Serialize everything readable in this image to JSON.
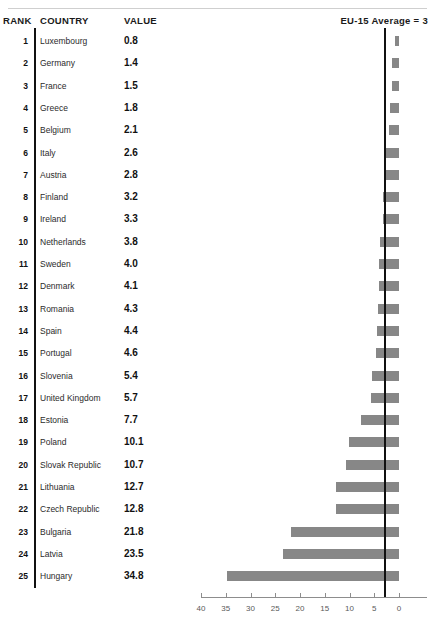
{
  "header": {
    "rank_label": "RANK",
    "country_label": "COUNTRY",
    "value_label": "VALUE",
    "average_label": "EU-15 Average = 3"
  },
  "colors": {
    "bar_fill": "#878787",
    "average_line": "#111111",
    "axis": "#8d8d8d",
    "divider": "#111111",
    "top_rule": "#cfcfcf"
  },
  "chart_data": {
    "type": "bar",
    "orientation": "horizontal",
    "title": "",
    "xlabel": "",
    "ylabel": "",
    "xlim": [
      40,
      0
    ],
    "x_axis_reversed": true,
    "grid": false,
    "legend": null,
    "tick_labels": [
      "40",
      "35",
      "30",
      "25",
      "20",
      "15",
      "10",
      "5",
      "0"
    ],
    "ticks": [
      40,
      35,
      30,
      25,
      20,
      15,
      10,
      5,
      0
    ],
    "reference_line": {
      "label": "EU-15 Average = 3",
      "value": 3
    },
    "categories": [
      "Luxembourg",
      "Germany",
      "France",
      "Greece",
      "Belgium",
      "Italy",
      "Austria",
      "Finland",
      "Ireland",
      "Netherlands",
      "Sweden",
      "Denmark",
      "Romania",
      "Spain",
      "Portugal",
      "Slovenia",
      "United Kingdom",
      "Estonia",
      "Poland",
      "Slovak Republic",
      "Lithuania",
      "Czech Republic",
      "Bulgaria",
      "Latvia",
      "Hungary"
    ],
    "values": [
      0.8,
      1.4,
      1.5,
      1.8,
      2.1,
      2.6,
      2.8,
      3.2,
      3.3,
      3.8,
      4.0,
      4.1,
      4.3,
      4.4,
      4.6,
      5.4,
      5.7,
      7.7,
      10.1,
      10.7,
      12.7,
      12.8,
      21.8,
      23.5,
      34.8
    ]
  },
  "rows": [
    {
      "rank": "1",
      "country": "Luxembourg",
      "value": "0.8",
      "num": 0.8
    },
    {
      "rank": "2",
      "country": "Germany",
      "value": "1.4",
      "num": 1.4
    },
    {
      "rank": "3",
      "country": "France",
      "value": "1.5",
      "num": 1.5
    },
    {
      "rank": "4",
      "country": "Greece",
      "value": "1.8",
      "num": 1.8
    },
    {
      "rank": "5",
      "country": "Belgium",
      "value": "2.1",
      "num": 2.1
    },
    {
      "rank": "6",
      "country": "Italy",
      "value": "2.6",
      "num": 2.6
    },
    {
      "rank": "7",
      "country": "Austria",
      "value": "2.8",
      "num": 2.8
    },
    {
      "rank": "8",
      "country": "Finland",
      "value": "3.2",
      "num": 3.2
    },
    {
      "rank": "9",
      "country": "Ireland",
      "value": "3.3",
      "num": 3.3
    },
    {
      "rank": "10",
      "country": "Netherlands",
      "value": "3.8",
      "num": 3.8
    },
    {
      "rank": "11",
      "country": "Sweden",
      "value": "4.0",
      "num": 4.0
    },
    {
      "rank": "12",
      "country": "Denmark",
      "value": "4.1",
      "num": 4.1
    },
    {
      "rank": "13",
      "country": "Romania",
      "value": "4.3",
      "num": 4.3
    },
    {
      "rank": "14",
      "country": "Spain",
      "value": "4.4",
      "num": 4.4
    },
    {
      "rank": "15",
      "country": "Portugal",
      "value": "4.6",
      "num": 4.6
    },
    {
      "rank": "16",
      "country": "Slovenia",
      "value": "5.4",
      "num": 5.4
    },
    {
      "rank": "17",
      "country": "United Kingdom",
      "value": "5.7",
      "num": 5.7
    },
    {
      "rank": "18",
      "country": "Estonia",
      "value": "7.7",
      "num": 7.7
    },
    {
      "rank": "19",
      "country": "Poland",
      "value": "10.1",
      "num": 10.1
    },
    {
      "rank": "20",
      "country": "Slovak Republic",
      "value": "10.7",
      "num": 10.7
    },
    {
      "rank": "21",
      "country": "Lithuania",
      "value": "12.7",
      "num": 12.7
    },
    {
      "rank": "22",
      "country": "Czech Republic",
      "value": "12.8",
      "num": 12.8
    },
    {
      "rank": "23",
      "country": "Bulgaria",
      "value": "21.8",
      "num": 21.8
    },
    {
      "rank": "24",
      "country": "Latvia",
      "value": "23.5",
      "num": 23.5
    },
    {
      "rank": "25",
      "country": "Hungary",
      "value": "34.8",
      "num": 34.8
    }
  ]
}
